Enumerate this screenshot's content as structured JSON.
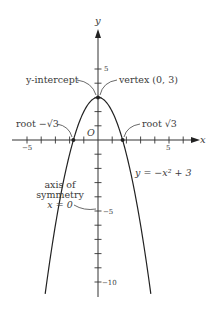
{
  "chart_data": {
    "type": "line",
    "title": "",
    "function": "y = -x^2 + 3",
    "equation_label": "y = −x² + 3",
    "xlabel": "x",
    "ylabel": "y",
    "xlim": [
      -6.9,
      7.3
    ],
    "ylim": [
      -11.2,
      7.8
    ],
    "x_ticks": [
      -5,
      -4,
      -3,
      -2,
      -1,
      1,
      2,
      3,
      4,
      5,
      6
    ],
    "x_tick_labels": {
      "-5": "−5",
      "5": "5"
    },
    "y_ticks": [
      -10,
      -9,
      -8,
      -7,
      -6,
      -5,
      -4,
      -3,
      -2,
      -1,
      1,
      2,
      3,
      4,
      5
    ],
    "y_tick_labels": {
      "5": "5",
      "-5": "−5",
      "-10": "−10"
    },
    "origin_label": "O",
    "grid": false,
    "legend": null,
    "curve_domain": [
      -3.72,
      3.72
    ],
    "key_points": [
      {
        "name": "vertex",
        "x": 0,
        "y": 3
      },
      {
        "name": "y-intercept",
        "x": 0,
        "y": 3
      },
      {
        "name": "root -√3",
        "x": -1.732,
        "y": 0
      },
      {
        "name": "root √3",
        "x": 1.732,
        "y": 0
      }
    ],
    "annotations": [
      {
        "text": "y-intercept",
        "points_to": [
          0,
          3
        ]
      },
      {
        "text": "vertex (0, 3)",
        "points_to": [
          0,
          3
        ]
      },
      {
        "text": "root −√3",
        "points_to": [
          -1.732,
          0
        ]
      },
      {
        "text": "root √3",
        "points_to": [
          1.732,
          0
        ]
      },
      {
        "text": "axis of symmetry x = 0",
        "points_to": [
          0,
          -5
        ]
      }
    ]
  },
  "labels": {
    "x_axis": "x",
    "y_axis": "y",
    "origin": "O",
    "tick_x_neg5": "−5",
    "tick_x_5": "5",
    "tick_y_5": "5",
    "tick_y_neg5": "−5",
    "tick_y_neg10": "−10",
    "y_intercept": "y-intercept",
    "vertex": "vertex (0, 3)",
    "root_neg": "root −√3",
    "root_pos": "root √3",
    "axis_sym_line1": "axis of",
    "axis_sym_line2": "symmetry",
    "axis_sym_line3": "x = 0",
    "equation": "y = −x² + 3"
  }
}
